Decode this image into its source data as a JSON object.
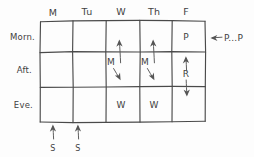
{
  "diagram": {
    "ink_color": "#4a4a4a",
    "paper_color": "#fdfdfd",
    "columns": [
      {
        "id": "mon",
        "label": "M"
      },
      {
        "id": "tue",
        "label": "Tu"
      },
      {
        "id": "wed",
        "label": "W"
      },
      {
        "id": "thu",
        "label": "Th"
      },
      {
        "id": "fri",
        "label": "F"
      }
    ],
    "rows": [
      {
        "id": "morning",
        "label": "Morn."
      },
      {
        "id": "afternoon",
        "label": "Aft."
      },
      {
        "id": "evening",
        "label": "Eve."
      }
    ],
    "cells": [
      {
        "row": "morning",
        "column": "fri",
        "label": "P"
      },
      {
        "row": "afternoon",
        "column": "wed",
        "label": "M"
      },
      {
        "row": "afternoon",
        "column": "thu",
        "label": "M"
      },
      {
        "row": "afternoon",
        "column": "fri",
        "label": "R"
      },
      {
        "row": "evening",
        "column": "wed",
        "label": "W"
      },
      {
        "row": "evening",
        "column": "thu",
        "label": "W"
      }
    ],
    "annotations": [
      {
        "id": "right-note",
        "label": "P...P",
        "arrow": "left"
      },
      {
        "id": "bottom-mon",
        "label": "S",
        "arrow": "up"
      },
      {
        "id": "bottom-tue",
        "label": "S",
        "arrow": "up"
      }
    ],
    "arrow_marks": [
      {
        "id": "wed-m-up",
        "direction": "up"
      },
      {
        "id": "wed-m-down",
        "direction": "down-right"
      },
      {
        "id": "thu-m-up",
        "direction": "up"
      },
      {
        "id": "thu-m-down",
        "direction": "down-right"
      },
      {
        "id": "fri-r-up",
        "direction": "up"
      },
      {
        "id": "fri-r-down",
        "direction": "down"
      }
    ]
  }
}
